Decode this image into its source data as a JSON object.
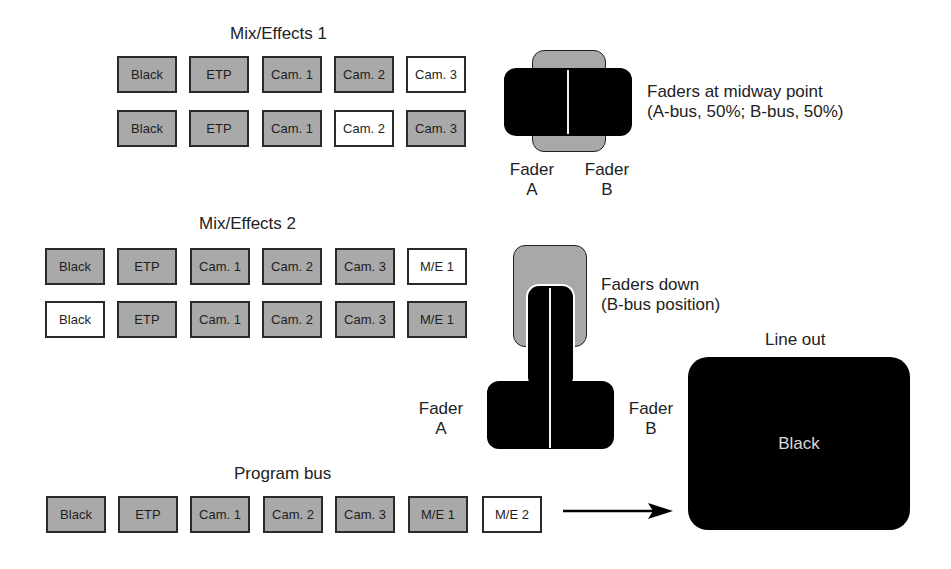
{
  "me1": {
    "title": "Mix/Effects 1",
    "rows": [
      {
        "buttons": [
          {
            "label": "Black",
            "selected": false
          },
          {
            "label": "ETP",
            "selected": false
          },
          {
            "label": "Cam. 1",
            "selected": false
          },
          {
            "label": "Cam. 2",
            "selected": false
          },
          {
            "label": "Cam. 3",
            "selected": true
          }
        ]
      },
      {
        "buttons": [
          {
            "label": "Black",
            "selected": false
          },
          {
            "label": "ETP",
            "selected": false
          },
          {
            "label": "Cam. 1",
            "selected": false
          },
          {
            "label": "Cam. 2",
            "selected": true
          },
          {
            "label": "Cam. 3",
            "selected": false
          }
        ]
      }
    ],
    "fader": {
      "caption_line1": "Faders at midway point",
      "caption_line2": "(A-bus, 50%; B-bus, 50%)",
      "label_a_line1": "Fader",
      "label_a_line2": "A",
      "label_b_line1": "Fader",
      "label_b_line2": "B"
    }
  },
  "me2": {
    "title": "Mix/Effects 2",
    "rows": [
      {
        "buttons": [
          {
            "label": "Black",
            "selected": false
          },
          {
            "label": "ETP",
            "selected": false
          },
          {
            "label": "Cam. 1",
            "selected": false
          },
          {
            "label": "Cam. 2",
            "selected": false
          },
          {
            "label": "Cam. 3",
            "selected": false
          },
          {
            "label": "M/E 1",
            "selected": true
          }
        ]
      },
      {
        "buttons": [
          {
            "label": "Black",
            "selected": true
          },
          {
            "label": "ETP",
            "selected": false
          },
          {
            "label": "Cam. 1",
            "selected": false
          },
          {
            "label": "Cam. 2",
            "selected": false
          },
          {
            "label": "Cam. 3",
            "selected": false
          },
          {
            "label": "M/E 1",
            "selected": false
          }
        ]
      }
    ],
    "fader": {
      "caption_line1": "Faders down",
      "caption_line2": "(B-bus position)",
      "label_a_line1": "Fader",
      "label_a_line2": "A",
      "label_b_line1": "Fader",
      "label_b_line2": "B"
    }
  },
  "program_bus": {
    "title": "Program bus",
    "buttons": [
      {
        "label": "Black",
        "selected": false
      },
      {
        "label": "ETP",
        "selected": false
      },
      {
        "label": "Cam. 1",
        "selected": false
      },
      {
        "label": "Cam. 2",
        "selected": false
      },
      {
        "label": "Cam. 3",
        "selected": false
      },
      {
        "label": "M/E 1",
        "selected": false
      },
      {
        "label": "M/E 2",
        "selected": true
      }
    ]
  },
  "line_out": {
    "title": "Line out",
    "content": "Black"
  },
  "colors": {
    "button_unselected": "#a9a9a9",
    "button_selected": "#ffffff",
    "fader_handle": "#000000",
    "line_out_bg": "#000000"
  }
}
